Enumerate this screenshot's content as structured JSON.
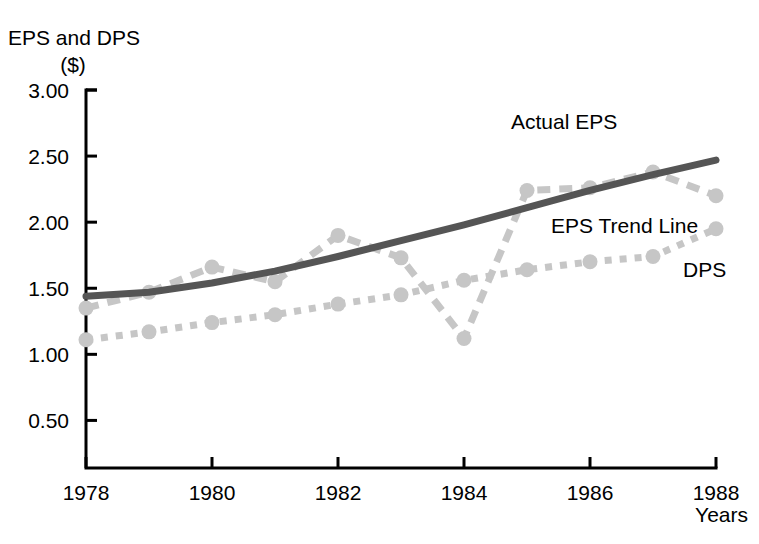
{
  "chart_data": {
    "type": "line",
    "title": "",
    "ylabel": "EPS and DPS ($)",
    "ylabel_line1": "EPS and DPS",
    "ylabel_line2": "($)",
    "xlabel": "Years",
    "x": [
      1978,
      1979,
      1980,
      1981,
      1982,
      1983,
      1984,
      1985,
      1986,
      1987,
      1988
    ],
    "xlim": [
      1978,
      1988
    ],
    "ylim": [
      0.14,
      3.0
    ],
    "grid": false,
    "legend_position": "inline-annotations",
    "y_ticks": [
      "0.50",
      "1.00",
      "1.50",
      "2.00",
      "2.50",
      "3.00"
    ],
    "y_tick_values": [
      0.5,
      1.0,
      1.5,
      2.0,
      2.5,
      3.0
    ],
    "x_ticks": [
      "1978",
      "1980",
      "1982",
      "1984",
      "1986",
      "1988"
    ],
    "x_tick_values": [
      1978,
      1980,
      1982,
      1984,
      1986,
      1988
    ],
    "series": [
      {
        "name": "Actual EPS",
        "style": "dashed-with-markers",
        "color": "#c6c6c6",
        "values": [
          1.35,
          1.47,
          1.66,
          1.55,
          1.9,
          1.73,
          1.12,
          2.24,
          2.26,
          2.38,
          2.2
        ]
      },
      {
        "name": "EPS Trend Line",
        "style": "solid",
        "color": "#555555",
        "values": [
          1.44,
          1.47,
          1.54,
          1.63,
          1.74,
          1.86,
          1.98,
          2.11,
          2.24,
          2.36,
          2.47
        ]
      },
      {
        "name": "DPS",
        "style": "dotted-with-markers",
        "color": "#c6c6c6",
        "values": [
          1.11,
          1.17,
          1.24,
          1.3,
          1.38,
          1.45,
          1.56,
          1.64,
          1.7,
          1.74,
          1.95
        ]
      }
    ],
    "annotations": [
      {
        "text": "Actual EPS",
        "x_px": 511,
        "y_px": 129
      },
      {
        "text": "EPS Trend Line",
        "x_px": 551,
        "y_px": 233
      },
      {
        "text": "DPS",
        "x_px": 683,
        "y_px": 277
      }
    ]
  },
  "axes": {
    "y_axis_label_top": "EPS and DPS",
    "y_axis_label_unit": "($)",
    "x_axis_label": "Years"
  }
}
